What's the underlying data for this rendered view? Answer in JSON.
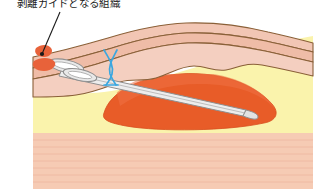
{
  "figure": {
    "kind": "surgical-anatomy-cross-section",
    "width": 327,
    "height": 195,
    "background": "#ffffff"
  },
  "annotations": [
    {
      "id": "guide-tissue-label",
      "text": "剥離ガイドとなる組織",
      "x": 17,
      "y": -3,
      "font_size": 10.5,
      "color": "#1a1a1a",
      "leader_line": {
        "from_x": 60,
        "from_y": 12,
        "to_x": 41,
        "to_y": 57,
        "color": "#1a1a1a",
        "width": 1.1
      }
    }
  ],
  "colors": {
    "skin_outer": "#f2c6b4",
    "skin_mid": "#efb9a4",
    "dermis_pink": "#f4cfc0",
    "fat_yellow": "#faf3ac",
    "fat_yellow_deep": "#f7eea0",
    "muscle_orange": "#e85c28",
    "muscle_orange_light": "#ef7a4a",
    "muscle_striated": "#f6cbb4",
    "muscle_striation_line": "#eab6a0",
    "outline_brown": "#8a6038",
    "outline_dark": "#6d4a2a",
    "instrument_gray": "#a8a8a8",
    "instrument_light": "#f0f0f0",
    "suture_blue": "#3aa7e0",
    "tissue_fragment": "#e8623a",
    "marker_dot": "#1a1a1a"
  },
  "elements": {
    "skin_layer": {
      "name": "skin-layer",
      "label": "skin / dermis band"
    },
    "fat_layer": {
      "name": "subcutaneous-fat-layer",
      "label": "subcutaneous fat"
    },
    "muscle_mass": {
      "name": "muscle-mass",
      "label": "muscle body"
    },
    "striated_muscle": {
      "name": "striated-muscle-layer",
      "label": "striated muscle base"
    },
    "instrument": {
      "name": "surgical-instrument",
      "label": "dissection forceps"
    },
    "suture": {
      "name": "suture-thread",
      "label": "blue suture marker"
    },
    "fragments": {
      "name": "tissue-fragments",
      "label": "detached guide tissue"
    },
    "marker_dot": {
      "name": "marker-dot",
      "label": "pointer terminus dot"
    }
  }
}
